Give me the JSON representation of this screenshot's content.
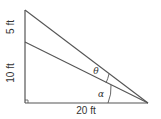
{
  "diagram": {
    "type": "right-triangle-angles",
    "labels": {
      "upper_segment": "5 ft",
      "lower_segment": "10 ft",
      "base": "20 ft",
      "theta": "θ",
      "alpha": "α"
    },
    "colors": {
      "line": "#555555",
      "text": "#333333",
      "background": "#ffffff"
    }
  }
}
